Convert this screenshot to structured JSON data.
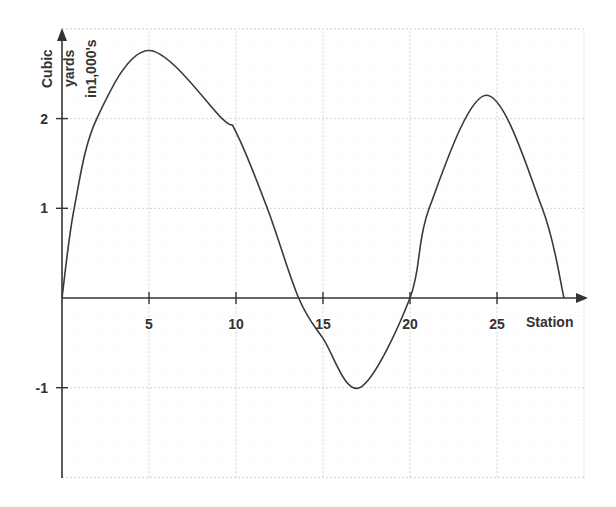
{
  "chart_data": {
    "type": "line",
    "title": "",
    "xlabel": "Station",
    "ylabel_lines": [
      "Cubic",
      "yards",
      "in1,000's"
    ],
    "ylabel": "Cubic yards in1,000's",
    "x_ticks": [
      5,
      10,
      15,
      20,
      25
    ],
    "x_tick_labels": [
      "5",
      "10",
      "15",
      "20",
      "25"
    ],
    "y_ticks": [
      2,
      1,
      -1
    ],
    "y_tick_labels": [
      "2",
      "1",
      "-1"
    ],
    "xlim": [
      0,
      30
    ],
    "ylim": [
      -2,
      3
    ],
    "grid": true,
    "legend": null,
    "series": [
      {
        "name": "Mass haul curve",
        "x": [
          0,
          0.7,
          2,
          5,
          9.2,
          10,
          11.8,
          13.6,
          15,
          17.1,
          20,
          21.1,
          24.4,
          27.6,
          28.85
        ],
        "y": [
          0,
          1,
          2,
          2.76,
          2,
          1.85,
          1,
          0,
          -0.45,
          -1,
          0,
          1,
          2.26,
          1,
          0
        ]
      }
    ]
  }
}
